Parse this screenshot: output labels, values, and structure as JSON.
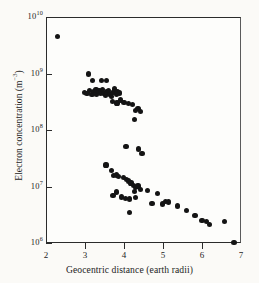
{
  "chart_data": {
    "type": "scatter",
    "title": "",
    "xlabel": "Geocentric distance (earth radii)",
    "ylabel": "Electron concentration (m−3)",
    "xlim": [
      2,
      7
    ],
    "ylim": [
      1000000,
      10000000000
    ],
    "yscale": "log",
    "xscale": "linear",
    "grid": false,
    "legend": null,
    "xticks": [
      2,
      3,
      4,
      5,
      6,
      7
    ],
    "xtick_labels": [
      "2",
      "3",
      "4",
      "5",
      "6",
      "7"
    ],
    "yticks": [
      1000000,
      10000000,
      100000000,
      1000000000,
      10000000000
    ],
    "ytick_labels": [
      "10",
      "10",
      "10",
      "10",
      "10"
    ],
    "ytick_exponents": [
      "6",
      "7",
      "8",
      "9",
      "10"
    ],
    "series": [
      {
        "name": "Electron concentration measurements",
        "marker": "filled-circle",
        "color": "#141414",
        "points": [
          [
            2.3,
            4500000000.0
          ],
          [
            3.08,
            980000000.0
          ],
          [
            3.2,
            750000000.0
          ],
          [
            3.42,
            760000000.0
          ],
          [
            3.55,
            740000000.0
          ],
          [
            2.98,
            460000000.0
          ],
          [
            3.05,
            440000000.0
          ],
          [
            3.12,
            500000000.0
          ],
          [
            3.18,
            420000000.0
          ],
          [
            3.22,
            480000000.0
          ],
          [
            3.28,
            510000000.0
          ],
          [
            3.3,
            430000000.0
          ],
          [
            3.36,
            490000000.0
          ],
          [
            3.4,
            450000000.0
          ],
          [
            3.44,
            520000000.0
          ],
          [
            3.48,
            440000000.0
          ],
          [
            3.52,
            410000000.0
          ],
          [
            3.56,
            470000000.0
          ],
          [
            3.6,
            500000000.0
          ],
          [
            3.64,
            430000000.0
          ],
          [
            3.68,
            390000000.0
          ],
          [
            3.72,
            460000000.0
          ],
          [
            3.76,
            530000000.0
          ],
          [
            3.8,
            420000000.0
          ],
          [
            3.84,
            480000000.0
          ],
          [
            3.88,
            450000000.0
          ],
          [
            3.7,
            320000000.0
          ],
          [
            3.82,
            300000000.0
          ],
          [
            3.92,
            340000000.0
          ],
          [
            4.0,
            310000000.0
          ],
          [
            4.12,
            290000000.0
          ],
          [
            4.22,
            280000000.0
          ],
          [
            4.3,
            220000000.0
          ],
          [
            4.36,
            240000000.0
          ],
          [
            4.42,
            210000000.0
          ],
          [
            4.26,
            155000000.0
          ],
          [
            4.05,
            51000000.0
          ],
          [
            4.38,
            46000000.0
          ],
          [
            4.46,
            39000000.0
          ],
          [
            3.54,
            24000000.0
          ],
          [
            3.68,
            19000000.0
          ],
          [
            3.74,
            15500000.0
          ],
          [
            3.8,
            16000000.0
          ],
          [
            3.86,
            15000000.0
          ],
          [
            3.98,
            14500000.0
          ],
          [
            4.06,
            13500000.0
          ],
          [
            4.12,
            12500000.0
          ],
          [
            4.18,
            11500000.0
          ],
          [
            4.24,
            10500000.0
          ],
          [
            4.3,
            9500000.0
          ],
          [
            4.36,
            10200000.0
          ],
          [
            4.42,
            8800000.0
          ],
          [
            3.72,
            6900000.0
          ],
          [
            3.8,
            8000000.0
          ],
          [
            3.94,
            6500000.0
          ],
          [
            4.04,
            6200000.0
          ],
          [
            4.14,
            6000000.0
          ],
          [
            4.26,
            8200000.0
          ],
          [
            4.3,
            6300000.0
          ],
          [
            4.6,
            8500000.0
          ],
          [
            4.72,
            5000000.0
          ],
          [
            4.86,
            7400000.0
          ],
          [
            4.98,
            4900000.0
          ],
          [
            5.06,
            5400000.0
          ],
          [
            5.14,
            5300000.0
          ],
          [
            4.14,
            3500000.0
          ],
          [
            5.38,
            4500000.0
          ],
          [
            5.6,
            3700000.0
          ],
          [
            5.82,
            3100000.0
          ],
          [
            6.0,
            2500000.0
          ],
          [
            6.12,
            2400000.0
          ],
          [
            6.2,
            2100000.0
          ],
          [
            6.58,
            2400000.0
          ],
          [
            6.82,
            1020000.0
          ]
        ]
      }
    ]
  }
}
